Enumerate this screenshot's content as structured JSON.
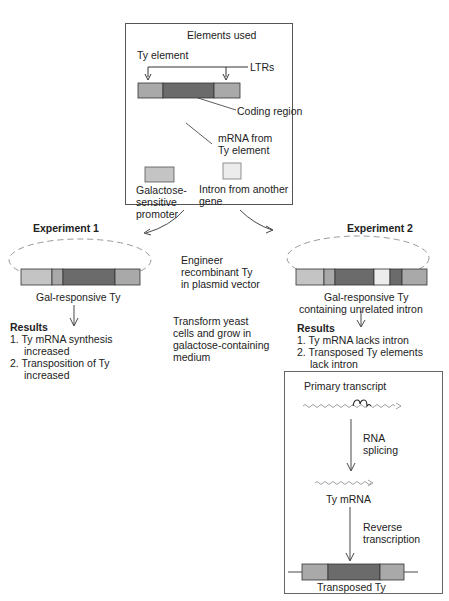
{
  "elements_box": {
    "title": "Elements used",
    "ty_element": "Ty element",
    "ltrs": "LTRs",
    "coding_region": "Coding region",
    "mrna_line1": "mRNA from",
    "mrna_line2": "Ty element",
    "gal_line1": "Galactose-",
    "gal_line2": "sensitive",
    "gal_line3": "promoter",
    "intron_line1": "Intron from another",
    "intron_line2": "gene"
  },
  "center": {
    "engineer_line1": "Engineer",
    "engineer_line2": "recombinant Ty",
    "engineer_line3": "in plasmid vector",
    "transform_line1": "Transform yeast",
    "transform_line2": "cells and grow in",
    "transform_line3": "galactose-containing",
    "transform_line4": "medium"
  },
  "experiment1": {
    "title": "Experiment 1",
    "label": "Gal-responsive Ty",
    "results_title": "Results",
    "r1_line1": "1. Ty mRNA synthesis",
    "r1_line2": "increased",
    "r2_line1": "2. Transposition of Ty",
    "r2_line2": "increased"
  },
  "experiment2": {
    "title": "Experiment 2",
    "label_line1": "Gal-responsive Ty",
    "label_line2": "containing unrelated intron",
    "results_title": "Results",
    "r1": "1. Ty mRNA lacks intron",
    "r2_line1": "2. Transposed Ty elements",
    "r2_line2": "lack intron"
  },
  "mechanism_box": {
    "primary": "Primary transcript",
    "splicing_line1": "RNA",
    "splicing_line2": "splicing",
    "ty_mrna": "Ty mRNA",
    "rt_line1": "Reverse",
    "rt_line2": "transcription",
    "transposed": "Transposed Ty"
  },
  "colors": {
    "ltr": "#a9a9a9",
    "coding": "#6b6b6b",
    "promoter": "#c4c4c4",
    "intron": "#ececec",
    "line": "#333333",
    "dashed": "#999999"
  }
}
